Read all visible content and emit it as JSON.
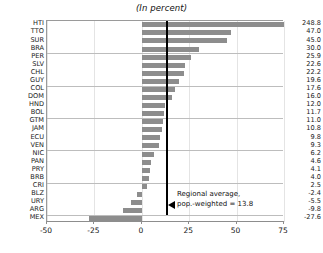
{
  "chart_data": {
    "type": "bar",
    "orientation": "horizontal",
    "title": "(In percent)",
    "xlabel": "",
    "ylabel": "",
    "xlim": [
      -50,
      75
    ],
    "xticks": [
      -50,
      -25,
      0,
      25,
      50,
      75
    ],
    "xtick_labels": [
      "-50",
      "-25",
      "0",
      "25",
      "50",
      "75"
    ],
    "grid": "horizontal-every-4-rows",
    "legend": "none",
    "bar_color": "#8d8d8d",
    "categories": [
      "HTI",
      "TTO",
      "SUR",
      "BRA",
      "PER",
      "SLV",
      "CHL",
      "GUY",
      "COL",
      "DOM",
      "HND",
      "BOL",
      "GTM",
      "JAM",
      "ECU",
      "VEN",
      "NIC",
      "PAN",
      "PRY",
      "BRB",
      "CRI",
      "BLZ",
      "URY",
      "ARG",
      "MEX"
    ],
    "values": [
      248.8,
      47.0,
      45.0,
      30.0,
      25.9,
      22.6,
      22.2,
      19.6,
      17.6,
      16.0,
      12.0,
      11.7,
      11.0,
      10.8,
      9.8,
      9.3,
      6.2,
      4.6,
      4.1,
      4.0,
      2.5,
      -2.4,
      -5.5,
      -9.8,
      -27.6
    ],
    "value_labels": [
      "248.8",
      "47.0",
      "45.0",
      "30.0",
      "25.9",
      "22.6",
      "22.2",
      "19.6",
      "17.6",
      "16.0",
      "12.0",
      "11.7",
      "11.0",
      "10.8",
      "9.8",
      "9.3",
      "6.2",
      "4.6",
      "4.1",
      "4.0",
      "2.5",
      "-2.4",
      "-5.5",
      "-9.8",
      "-27.6"
    ],
    "clipped_bars": [
      "HTI"
    ],
    "annotations": [
      {
        "name": "regional-average",
        "value": 13.8,
        "line1": "Regional average,",
        "line2": "pop.-weighted = 13.8",
        "marker": "left-arrow",
        "color": "#000000"
      }
    ]
  }
}
